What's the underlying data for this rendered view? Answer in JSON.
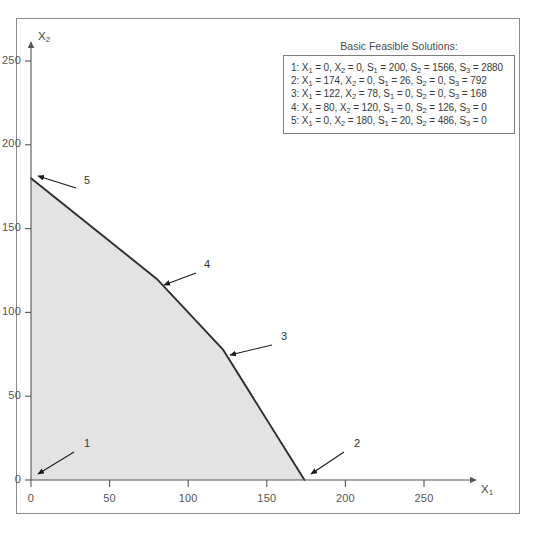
{
  "figure": {
    "background_color": "#ffffff",
    "border_color": "#8a8a8a"
  },
  "legend": {
    "title": "Basic Feasible Solutions:",
    "rows": [
      {
        "index": "1",
        "text": "1: X1 = 0, X2 = 0, S1 = 200, S2 = 1566, S3 = 2880",
        "X1": 0,
        "X2": 0,
        "S1": 200,
        "S2": 1566,
        "S3": 2880
      },
      {
        "index": "2",
        "text": "2: X1 = 174, X2 = 0, S1 = 26, S2 = 0, S3 = 792",
        "X1": 174,
        "X2": 0,
        "S1": 26,
        "S2": 0,
        "S3": 792
      },
      {
        "index": "3",
        "text": "3: X1 = 122, X2 = 78, S1 = 0, S2 = 0, S3 = 168",
        "X1": 122,
        "X2": 78,
        "S1": 0,
        "S2": 0,
        "S3": 168
      },
      {
        "index": "4",
        "text": "4: X1 = 80, X2 = 120, S1 = 0, S2 = 126, S3 = 0",
        "X1": 80,
        "X2": 120,
        "S1": 0,
        "S2": 126,
        "S3": 0
      },
      {
        "index": "5",
        "text": "5: X1 = 0, X2 = 180, S1 = 20, S2 = 486, S3 = 0",
        "X1": 0,
        "X2": 180,
        "S1": 20,
        "S2": 486,
        "S3": 0
      }
    ]
  },
  "chart_data": {
    "type": "area",
    "title": "",
    "xlabel": "X1",
    "ylabel": "X2",
    "xlim": [
      0,
      275
    ],
    "ylim": [
      0,
      272
    ],
    "grid": false,
    "legend_position": "top-right",
    "x_ticks": [
      0,
      50,
      100,
      150,
      200,
      250
    ],
    "y_ticks": [
      0,
      50,
      100,
      150,
      200,
      250
    ],
    "x_tick_labels": [
      "0",
      "50",
      "100",
      "150",
      "200",
      "250"
    ],
    "y_tick_labels": [
      "0",
      "50",
      "100",
      "150",
      "200",
      "250"
    ],
    "feasible_region": {
      "name": "Feasible region",
      "fill_color": "#e3e3e3",
      "edge_color": "#2e2e2e",
      "vertices": [
        {
          "label": "1",
          "x": 0,
          "y": 0
        },
        {
          "label": "2",
          "x": 174,
          "y": 0
        },
        {
          "label": "3",
          "x": 122,
          "y": 78
        },
        {
          "label": "4",
          "x": 80,
          "y": 120
        },
        {
          "label": "5",
          "x": 0,
          "y": 180
        }
      ]
    },
    "vertex_annotations": [
      {
        "label": "1",
        "x": 0,
        "y": 0
      },
      {
        "label": "2",
        "x": 174,
        "y": 0
      },
      {
        "label": "3",
        "x": 122,
        "y": 78
      },
      {
        "label": "4",
        "x": 80,
        "y": 120
      },
      {
        "label": "5",
        "x": 0,
        "y": 180
      }
    ]
  }
}
